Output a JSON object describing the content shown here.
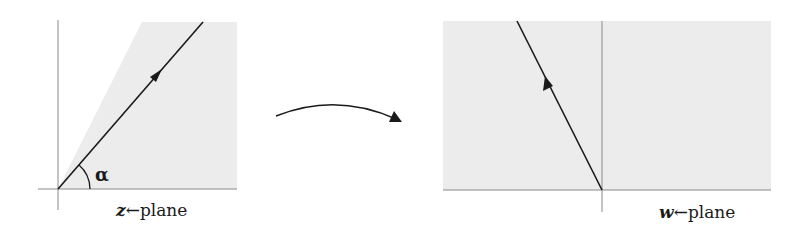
{
  "diagram": {
    "colors": {
      "shade": "#ececec",
      "axis": "#8a8a8a",
      "line": "#1a1a1a",
      "background": "#ffffff"
    },
    "left_panel": {
      "variable": "z",
      "arrow_glyph": "←",
      "suffix": "plane",
      "angle_label": "α",
      "description": "Shaded wedge of angle alpha bounded by a ray from the origin, with a direction arrow pointing outward along the ray"
    },
    "mapping_arrow": {
      "description": "Curved arrow indicating mapping from z-plane to w-plane"
    },
    "right_panel": {
      "variable": "w",
      "arrow_glyph": "←",
      "suffix": "plane",
      "description": "Shaded upper half-plane with a ray from the origin into the second quadrant, direction arrow pointing outward"
    }
  }
}
